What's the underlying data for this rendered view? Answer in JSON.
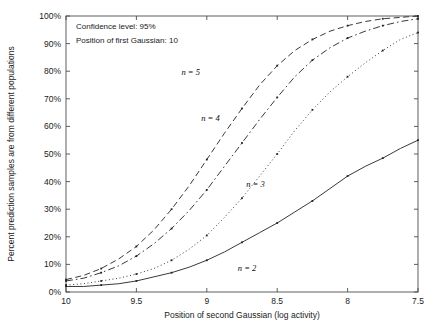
{
  "figure": {
    "title": "",
    "annotations": [
      {
        "name": "confidence-level",
        "text": "Confidence level: 95%"
      },
      {
        "name": "first-gaussian",
        "text": "Position of first Gaussian: 10"
      }
    ]
  },
  "chart_data": {
    "type": "line",
    "title": "",
    "xlabel": "Position of second Gaussian (log activity)",
    "ylabel": "Percent prediction samples are from different populations",
    "xlim": [
      10,
      7.5
    ],
    "ylim": [
      0,
      100
    ],
    "x_reversed": true,
    "grid": false,
    "legend": "inline-curve-labels",
    "xticks": [
      10,
      9.5,
      9,
      8.5,
      8,
      7.5
    ],
    "xticklabels": [
      "10",
      "9.5",
      "9",
      "8.5",
      "8",
      "7.5"
    ],
    "yticks": [
      0,
      10,
      20,
      30,
      40,
      50,
      60,
      70,
      80,
      90,
      100
    ],
    "yticklabels": [
      "0%",
      "10%",
      "20%",
      "30%",
      "40%",
      "50%",
      "60%",
      "70%",
      "80%",
      "90%",
      "100%"
    ],
    "x": [
      10,
      9.875,
      9.75,
      9.625,
      9.5,
      9.375,
      9.25,
      9.125,
      9,
      8.875,
      8.75,
      8.625,
      8.5,
      8.375,
      8.25,
      8.125,
      8,
      7.875,
      7.75,
      7.625,
      7.5
    ],
    "series": [
      {
        "name": "n = 2",
        "label": "n = 2",
        "style": "solid",
        "label_x": 8.78,
        "label_y": 7.5,
        "values": [
          2,
          2,
          2.5,
          3,
          4,
          5.5,
          7,
          9,
          11.5,
          14.5,
          18,
          21.5,
          25,
          29,
          33,
          37.5,
          42,
          45.5,
          48.5,
          52,
          55
        ]
      },
      {
        "name": "n = 3",
        "label": "n = 3",
        "style": "dotted",
        "label_x": 8.72,
        "label_y": 38,
        "values": [
          2.5,
          3,
          4,
          5,
          6.5,
          8.5,
          11.5,
          15.5,
          20.5,
          27,
          34,
          42,
          50,
          58.5,
          66,
          72.5,
          78,
          83,
          87.5,
          91.5,
          94
        ]
      },
      {
        "name": "n = 4",
        "label": "n = 4",
        "style": "dashdot",
        "label_x": 9.04,
        "label_y": 62,
        "values": [
          4,
          5,
          7,
          9.5,
          13,
          17.5,
          23,
          29.5,
          37,
          45.5,
          54,
          62.5,
          70.5,
          78,
          84,
          88.5,
          92,
          94.5,
          96.5,
          98,
          99
        ]
      },
      {
        "name": "n = 5",
        "label": "n = 5",
        "style": "dashed",
        "label_x": 9.18,
        "label_y": 78.5,
        "values": [
          4.5,
          6,
          8.5,
          12,
          16.5,
          22.5,
          30,
          38.5,
          48,
          57.5,
          66.5,
          75,
          82,
          87.5,
          91.5,
          94.5,
          96.5,
          98,
          99,
          99.5,
          100
        ]
      }
    ]
  }
}
